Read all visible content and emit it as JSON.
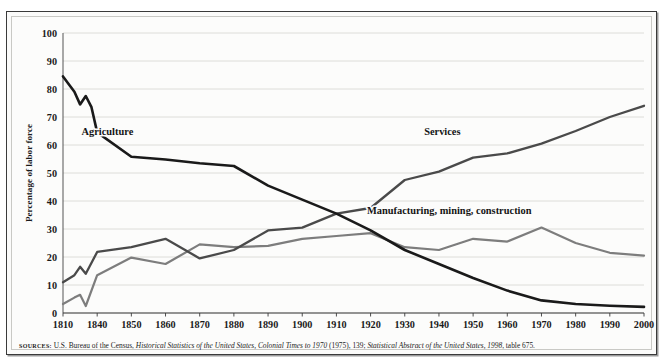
{
  "figure": {
    "source_prefix": "SOURCES:",
    "source_text_1": " U.S. Bureau of the Census, ",
    "source_italic_1": "Historical Statistics of the United States, Colonial Times to 1970",
    "source_text_2": " (1975), 139; ",
    "source_italic_2": "Statistical Abstract of the United States, 1998",
    "source_text_3": ", table 675."
  },
  "chart_data": {
    "type": "line",
    "title": "",
    "xlabel": "",
    "ylabel": "Percentage of labor force",
    "ylim": [
      0,
      100
    ],
    "xlim": [
      1810,
      2000
    ],
    "grid": true,
    "legend": "inline-annotations",
    "ytick_labels": [
      "0",
      "10",
      "20",
      "30",
      "40",
      "50",
      "60",
      "70",
      "80",
      "90",
      "100"
    ],
    "ytick_values": [
      0,
      10,
      20,
      30,
      40,
      50,
      60,
      70,
      80,
      90,
      100
    ],
    "xtick_labels": [
      "1810",
      "1840",
      "1850",
      "1860",
      "1870",
      "1880",
      "1890",
      "1900",
      "1910",
      "1920",
      "1930",
      "1940",
      "1950",
      "1960",
      "1970",
      "1980",
      "1990",
      "2000"
    ],
    "xtick_values": [
      1810,
      1840,
      1850,
      1860,
      1870,
      1880,
      1890,
      1900,
      1910,
      1920,
      1930,
      1940,
      1950,
      1960,
      1970,
      1980,
      1990,
      2000
    ],
    "series": [
      {
        "name": "Agriculture",
        "color": "#1a1a1a",
        "label_x": 1843,
        "label_y": 63.5,
        "x": [
          1810,
          1820,
          1825,
          1830,
          1835,
          1840,
          1850,
          1860,
          1870,
          1880,
          1890,
          1900,
          1910,
          1920,
          1930,
          1940,
          1950,
          1960,
          1970,
          1980,
          1990,
          2000
        ],
        "y": [
          84.5,
          79,
          74.5,
          77.5,
          73.5,
          64.5,
          55.8,
          54.8,
          53.5,
          52.5,
          45.5,
          40.5,
          35.5,
          29.5,
          22.5,
          17.5,
          12.5,
          8.0,
          4.5,
          3.2,
          2.6,
          2.2
        ]
      },
      {
        "name": "Services",
        "color": "#4a4a4a",
        "label_x": 1941,
        "label_y": 63.5,
        "x": [
          1810,
          1820,
          1825,
          1830,
          1840,
          1850,
          1860,
          1870,
          1880,
          1890,
          1900,
          1910,
          1920,
          1930,
          1940,
          1950,
          1960,
          1970,
          1980,
          1990,
          2000
        ],
        "y": [
          11.0,
          13.5,
          16.5,
          14.0,
          21.8,
          23.5,
          26.5,
          19.5,
          22.5,
          29.5,
          30.5,
          35.5,
          37.5,
          47.5,
          50.5,
          55.5,
          57.0,
          60.5,
          65.0,
          70.0,
          74.0
        ]
      },
      {
        "name": "Manufacturing, mining, construction",
        "color": "#7d7d7d",
        "label_x": 1943,
        "label_y": 35.5,
        "x": [
          1810,
          1820,
          1825,
          1830,
          1840,
          1850,
          1860,
          1870,
          1880,
          1890,
          1900,
          1910,
          1920,
          1930,
          1940,
          1950,
          1960,
          1970,
          1980,
          1990,
          2000
        ],
        "y": [
          3.2,
          5.5,
          6.5,
          2.5,
          13.5,
          19.8,
          17.5,
          24.5,
          23.5,
          24.0,
          26.5,
          27.5,
          28.5,
          23.5,
          22.5,
          26.5,
          25.5,
          30.5,
          25.0,
          21.5,
          20.5
        ]
      }
    ]
  }
}
